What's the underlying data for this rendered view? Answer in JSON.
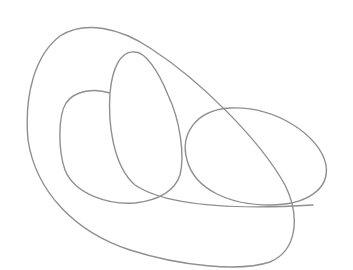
{
  "canvas": {
    "width": 353,
    "height": 270,
    "background": "#ffffff"
  },
  "drawing": {
    "stroke_color": "#8f8f8f",
    "description": "single continuous gray line forming overlapping loops",
    "shapes": [
      {
        "name": "outer-loop"
      },
      {
        "name": "inner-left-lobe"
      },
      {
        "name": "middle-tall-lobe"
      },
      {
        "name": "right-ellipse"
      }
    ]
  }
}
